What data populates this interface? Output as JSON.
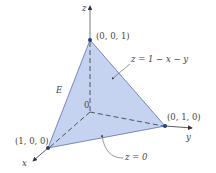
{
  "figure": {
    "axes": {
      "x": "x",
      "y": "y",
      "z": "z"
    },
    "origin_label": "0",
    "region_label": "E",
    "vertices": [
      {
        "label": "(0, 0, 1)"
      },
      {
        "label": "(1, 0, 0)"
      },
      {
        "label": "(0, 1, 0)"
      }
    ],
    "annotations": {
      "top_plane": "z = 1 − x − y",
      "bottom_plane": "z = 0"
    },
    "colors": {
      "fill": "#c5d3f0",
      "edge": "#5a6fb0",
      "vertex": "#1f3c8c",
      "axis": "#333333"
    }
  }
}
